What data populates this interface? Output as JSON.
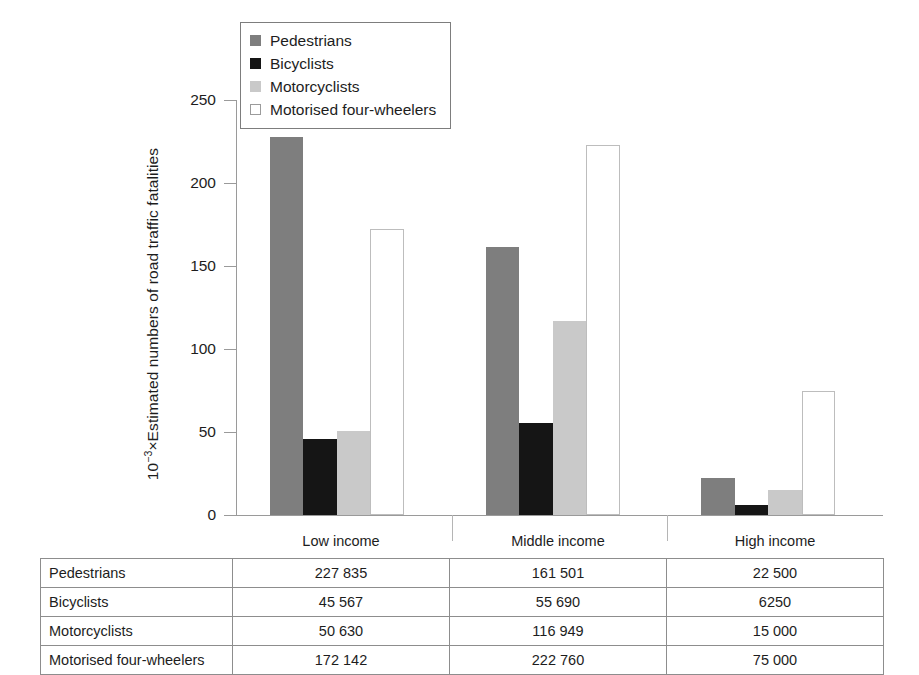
{
  "chart_data": {
    "type": "bar",
    "title": "",
    "xlabel": "",
    "ylabel": "10⁻³×Estimated numbers of road traffic fatalities",
    "ylabel_prefix": "10",
    "ylabel_exponent": "−3",
    "ylabel_rest": "×Estimated numbers of road traffic fatalities",
    "categories": [
      "Low income",
      "Middle income",
      "High income"
    ],
    "ylim": [
      0,
      250
    ],
    "yticks": [
      0,
      50,
      100,
      150,
      200,
      250
    ],
    "ytick_labels": [
      "0",
      "50",
      "100",
      "150",
      "200",
      "250"
    ],
    "grid": false,
    "legend_position": "top-left",
    "units_note": "values plotted in thousands (10^-3 × fatalities)",
    "series": [
      {
        "name": "Pedestrians",
        "color": "#7e7e7e",
        "values": [
          227.835,
          161.501,
          22.5
        ],
        "raw": [
          "227 835",
          "161 501",
          "22 500"
        ]
      },
      {
        "name": "Bicyclists",
        "color": "#151515",
        "values": [
          45.567,
          55.69,
          6.25
        ],
        "raw": [
          "45 567",
          "55 690",
          "6250"
        ]
      },
      {
        "name": "Motorcyclists",
        "color": "#c9c9c9",
        "values": [
          50.63,
          116.949,
          15.0
        ],
        "raw": [
          "50 630",
          "116 949",
          "15 000"
        ]
      },
      {
        "name": "Motorised four-wheelers",
        "color": "#ffffff",
        "values": [
          172.142,
          222.76,
          75.0
        ],
        "raw": [
          "172 142",
          "222 760",
          "75 000"
        ]
      }
    ]
  },
  "legend": {
    "items": [
      {
        "label": "Pedestrians"
      },
      {
        "label": "Bicyclists"
      },
      {
        "label": "Motorcyclists"
      },
      {
        "label": "Motorised four-wheelers"
      }
    ]
  },
  "table": {
    "corner": "",
    "columns": [
      "Low income",
      "Middle income",
      "High income"
    ],
    "rows": [
      {
        "label": "Pedestrians",
        "values": [
          "227 835",
          "161 501",
          "22 500"
        ]
      },
      {
        "label": "Bicyclists",
        "values": [
          "45 567",
          "55 690",
          "6250"
        ]
      },
      {
        "label": "Motorcyclists",
        "values": [
          "50 630",
          "116 949",
          "15 000"
        ]
      },
      {
        "label": "Motorised four-wheelers",
        "values": [
          "172 142",
          "222 760",
          "75 000"
        ]
      }
    ]
  },
  "colors": {
    "pedestrians": "#7e7e7e",
    "bicyclists": "#151515",
    "motorcyclists": "#c9c9c9",
    "fourwheelers": "#ffffff",
    "axis": "#9a9a9a",
    "text": "#1d1d1d",
    "table_border": "#8d8d8d"
  }
}
